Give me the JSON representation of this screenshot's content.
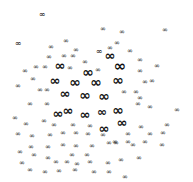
{
  "image": {
    "description": "Scatter cloud of infinity symbols of varying sizes, densest near center",
    "glyph": "∞",
    "color": "#111111",
    "background": "#ffffff"
  },
  "symbols": [
    {
      "x": 42,
      "y": 15,
      "s": 8
    },
    {
      "x": 103,
      "y": 29,
      "s": 7
    },
    {
      "x": 122,
      "y": 32,
      "s": 7
    },
    {
      "x": 165,
      "y": 30,
      "s": 7
    },
    {
      "x": 18,
      "y": 44,
      "s": 8
    },
    {
      "x": 51,
      "y": 47,
      "s": 7
    },
    {
      "x": 66,
      "y": 41,
      "s": 7
    },
    {
      "x": 117,
      "y": 43,
      "s": 7
    },
    {
      "x": 110,
      "y": 48,
      "s": 7
    },
    {
      "x": 76,
      "y": 50,
      "s": 7
    },
    {
      "x": 49,
      "y": 57,
      "s": 7
    },
    {
      "x": 64,
      "y": 56,
      "s": 7
    },
    {
      "x": 73,
      "y": 56,
      "s": 7
    },
    {
      "x": 99,
      "y": 52,
      "s": 8
    },
    {
      "x": 130,
      "y": 51,
      "s": 7
    },
    {
      "x": 85,
      "y": 62,
      "s": 7
    },
    {
      "x": 60,
      "y": 65,
      "s": 13
    },
    {
      "x": 70,
      "y": 68,
      "s": 7
    },
    {
      "x": 110,
      "y": 55,
      "s": 13
    },
    {
      "x": 140,
      "y": 60,
      "s": 7
    },
    {
      "x": 157,
      "y": 66,
      "s": 7
    },
    {
      "x": 25,
      "y": 71,
      "s": 7
    },
    {
      "x": 36,
      "y": 67,
      "s": 7
    },
    {
      "x": 45,
      "y": 67,
      "s": 7
    },
    {
      "x": 88,
      "y": 72,
      "s": 14
    },
    {
      "x": 98,
      "y": 70,
      "s": 7
    },
    {
      "x": 120,
      "y": 66,
      "s": 15
    },
    {
      "x": 140,
      "y": 71,
      "s": 7
    },
    {
      "x": 33,
      "y": 79,
      "s": 7
    },
    {
      "x": 55,
      "y": 80,
      "s": 13
    },
    {
      "x": 75,
      "y": 82,
      "s": 14
    },
    {
      "x": 96,
      "y": 82,
      "s": 14
    },
    {
      "x": 118,
      "y": 80,
      "s": 14
    },
    {
      "x": 145,
      "y": 82,
      "s": 7
    },
    {
      "x": 152,
      "y": 81,
      "s": 7
    },
    {
      "x": 18,
      "y": 86,
      "s": 7
    },
    {
      "x": 40,
      "y": 90,
      "s": 7
    },
    {
      "x": 47,
      "y": 90,
      "s": 7
    },
    {
      "x": 65,
      "y": 93,
      "s": 13
    },
    {
      "x": 85,
      "y": 95,
      "s": 14
    },
    {
      "x": 104,
      "y": 96,
      "s": 14
    },
    {
      "x": 124,
      "y": 92,
      "s": 7
    },
    {
      "x": 136,
      "y": 92,
      "s": 7
    },
    {
      "x": 140,
      "y": 98,
      "s": 7
    },
    {
      "x": 30,
      "y": 104,
      "s": 7
    },
    {
      "x": 47,
      "y": 104,
      "s": 7
    },
    {
      "x": 58,
      "y": 113,
      "s": 13
    },
    {
      "x": 68,
      "y": 110,
      "s": 13
    },
    {
      "x": 85,
      "y": 114,
      "s": 13
    },
    {
      "x": 102,
      "y": 112,
      "s": 12
    },
    {
      "x": 118,
      "y": 110,
      "s": 14
    },
    {
      "x": 138,
      "y": 104,
      "s": 7
    },
    {
      "x": 150,
      "y": 107,
      "s": 7
    },
    {
      "x": 177,
      "y": 110,
      "s": 7
    },
    {
      "x": 15,
      "y": 118,
      "s": 7
    },
    {
      "x": 26,
      "y": 124,
      "s": 7
    },
    {
      "x": 44,
      "y": 121,
      "s": 7
    },
    {
      "x": 54,
      "y": 125,
      "s": 7
    },
    {
      "x": 73,
      "y": 125,
      "s": 7
    },
    {
      "x": 90,
      "y": 126,
      "s": 7
    },
    {
      "x": 104,
      "y": 128,
      "s": 13
    },
    {
      "x": 122,
      "y": 122,
      "s": 13
    },
    {
      "x": 141,
      "y": 127,
      "s": 7
    },
    {
      "x": 167,
      "y": 125,
      "s": 7
    },
    {
      "x": 18,
      "y": 134,
      "s": 7
    },
    {
      "x": 32,
      "y": 136,
      "s": 7
    },
    {
      "x": 50,
      "y": 135,
      "s": 7
    },
    {
      "x": 63,
      "y": 133,
      "s": 7
    },
    {
      "x": 76,
      "y": 133,
      "s": 7
    },
    {
      "x": 88,
      "y": 134,
      "s": 7
    },
    {
      "x": 103,
      "y": 135,
      "s": 7
    },
    {
      "x": 128,
      "y": 134,
      "s": 7
    },
    {
      "x": 150,
      "y": 134,
      "s": 7
    },
    {
      "x": 163,
      "y": 133,
      "s": 7
    },
    {
      "x": 31,
      "y": 147,
      "s": 7
    },
    {
      "x": 48,
      "y": 147,
      "s": 7
    },
    {
      "x": 63,
      "y": 145,
      "s": 7
    },
    {
      "x": 76,
      "y": 146,
      "s": 7
    },
    {
      "x": 92,
      "y": 146,
      "s": 7
    },
    {
      "x": 115,
      "y": 142,
      "s": 7
    },
    {
      "x": 128,
      "y": 142,
      "s": 7
    },
    {
      "x": 145,
      "y": 142,
      "s": 7
    },
    {
      "x": 20,
      "y": 152,
      "s": 7
    },
    {
      "x": 34,
      "y": 155,
      "s": 7
    },
    {
      "x": 48,
      "y": 158,
      "s": 7
    },
    {
      "x": 72,
      "y": 155,
      "s": 7
    },
    {
      "x": 87,
      "y": 155,
      "s": 7
    },
    {
      "x": 109,
      "y": 143,
      "s": 7
    },
    {
      "x": 116,
      "y": 143,
      "s": 7
    },
    {
      "x": 133,
      "y": 145,
      "s": 7
    },
    {
      "x": 162,
      "y": 145,
      "s": 7
    },
    {
      "x": 22,
      "y": 163,
      "s": 7
    },
    {
      "x": 56,
      "y": 162,
      "s": 7
    },
    {
      "x": 67,
      "y": 162,
      "s": 7
    },
    {
      "x": 77,
      "y": 164,
      "s": 7
    },
    {
      "x": 90,
      "y": 162,
      "s": 7
    },
    {
      "x": 108,
      "y": 163,
      "s": 7
    },
    {
      "x": 121,
      "y": 160,
      "s": 7
    },
    {
      "x": 139,
      "y": 158,
      "s": 7
    },
    {
      "x": 30,
      "y": 170,
      "s": 7
    },
    {
      "x": 75,
      "y": 170,
      "s": 7
    },
    {
      "x": 45,
      "y": 172,
      "s": 7
    },
    {
      "x": 59,
      "y": 171,
      "s": 7
    },
    {
      "x": 94,
      "y": 172,
      "s": 7
    },
    {
      "x": 109,
      "y": 172,
      "s": 7
    },
    {
      "x": 125,
      "y": 177,
      "s": 7
    }
  ]
}
